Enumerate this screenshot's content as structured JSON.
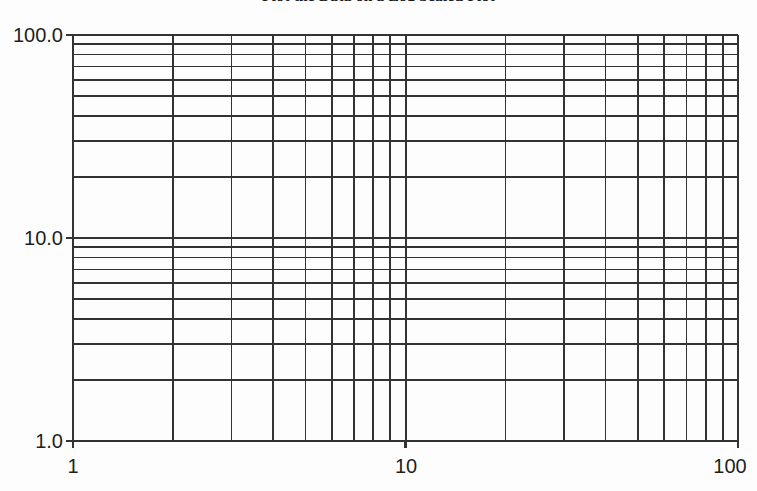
{
  "figure": {
    "title": "Plot the Data on a Log Scaled Plot",
    "background_color": "#fdfdfd",
    "line_color": "#333333",
    "text_color": "#1e1e1e"
  },
  "axes": {
    "y_labels": [
      "100.0",
      "10.0",
      "1.0"
    ],
    "x_labels": [
      "1",
      "10",
      "100"
    ]
  },
  "chart_data": {
    "type": "line",
    "title": "Plot the Data on a Log Scaled Plot",
    "subtitle": "",
    "xlabel": "",
    "ylabel": "",
    "xscale": "log",
    "yscale": "log",
    "xlim": [
      1,
      100
    ],
    "ylim": [
      1,
      100
    ],
    "grid": true,
    "grid_minor": true,
    "legend": false,
    "legend_position": "none",
    "series": [],
    "x_tick_labels": [
      "1",
      "10",
      "100"
    ],
    "x_tick_values": [
      1,
      10,
      100
    ],
    "y_tick_labels": [
      "1.0",
      "10.0",
      "100.0"
    ],
    "y_tick_values": [
      1,
      10,
      100
    ],
    "x_minor_ticks": [
      2,
      3,
      4,
      5,
      6,
      7,
      8,
      9,
      20,
      30,
      40,
      50,
      60,
      70,
      80,
      90
    ],
    "y_minor_ticks": [
      2,
      3,
      4,
      5,
      6,
      7,
      8,
      9,
      20,
      30,
      40,
      50,
      60,
      70,
      80,
      90
    ],
    "annotations": [],
    "note": "Empty log-log grid (blank graph paper) with no plotted data series."
  },
  "geometry": {
    "plot_left": 73,
    "plot_right": 738,
    "plot_top": 35,
    "plot_bottom": 441
  }
}
